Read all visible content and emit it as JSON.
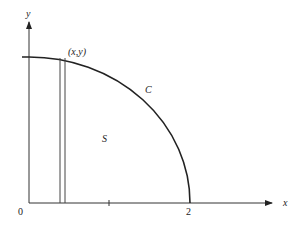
{
  "diagram": {
    "type": "region-under-curve",
    "axes": {
      "x_label": "x",
      "y_label": "y",
      "origin_label": "0",
      "x_tick_labels": [
        "2"
      ]
    },
    "curve_label": "C",
    "region_label": "S",
    "point_label": "(x,y)",
    "colors": {
      "stroke": "#222222",
      "background": "#ffffff"
    }
  }
}
